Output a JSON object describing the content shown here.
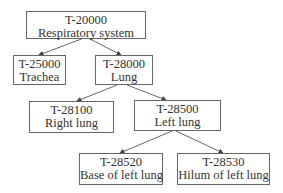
{
  "diagram": {
    "type": "tree",
    "nodes": [
      {
        "id": "n1",
        "code": "T-20000",
        "label": "Respiratory system"
      },
      {
        "id": "n2",
        "code": "T-25000",
        "label": "Trachea"
      },
      {
        "id": "n3",
        "code": "T-28000",
        "label": "Lung"
      },
      {
        "id": "n4",
        "code": "T-28100",
        "label": "Right lung"
      },
      {
        "id": "n5",
        "code": "T-28500",
        "label": "Left lung"
      },
      {
        "id": "n6",
        "code": "T-28520",
        "label": "Base of left lung"
      },
      {
        "id": "n7",
        "code": "T-28530",
        "label": "Hilum of left lung"
      }
    ],
    "edges": [
      {
        "from": "T-20000",
        "to": "T-25000"
      },
      {
        "from": "T-20000",
        "to": "T-28000"
      },
      {
        "from": "T-28000",
        "to": "T-28100"
      },
      {
        "from": "T-28000",
        "to": "T-28500"
      },
      {
        "from": "T-28500",
        "to": "T-28520"
      },
      {
        "from": "T-28500",
        "to": "T-28530"
      }
    ]
  }
}
